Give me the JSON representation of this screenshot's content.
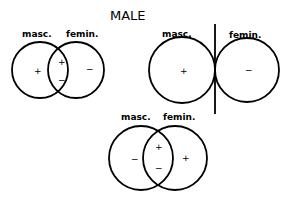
{
  "title": "MALE",
  "colors": {
    "stroke": "#000000",
    "background": "#ffffff"
  },
  "diagrams": [
    {
      "masc_label": "masc.",
      "femin_label": "femin.",
      "signs": {
        "masc_only": "+",
        "overlap_top": "+",
        "overlap_bottom": "−",
        "femin_only": "−"
      }
    },
    {
      "masc_label": "masc.",
      "femin_label": "femin.",
      "signs": {
        "masc": "+",
        "femin": "−"
      }
    },
    {
      "masc_label": "masc.",
      "femin_label": "femin.",
      "signs": {
        "masc_only": "−",
        "overlap_top": "+",
        "overlap_bottom": "−",
        "femin_only": "+"
      }
    }
  ]
}
